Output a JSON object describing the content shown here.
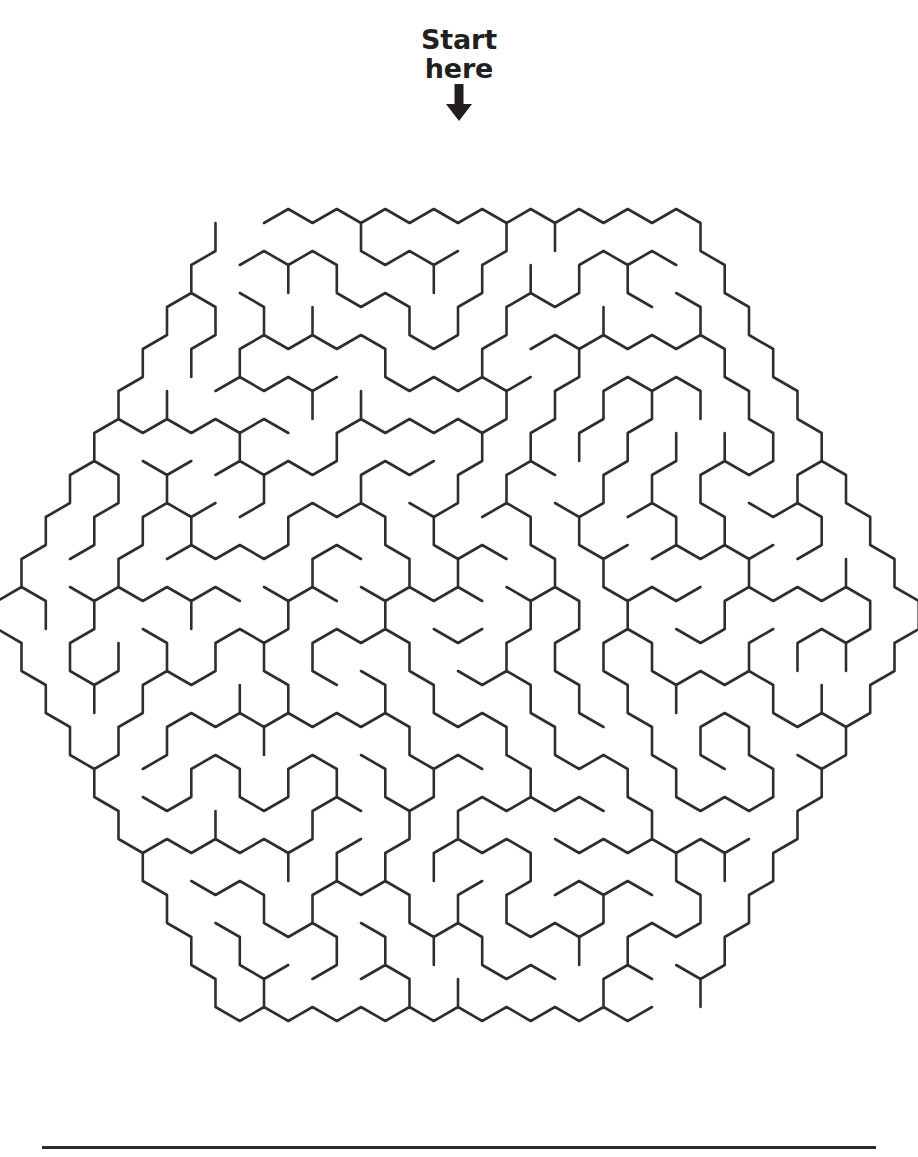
{
  "page": {
    "background_color": "#ffffff",
    "width": 918,
    "height": 1157
  },
  "start_marker": {
    "label": "Start\nhere",
    "label_line_1": "Start",
    "label_line_2": "here",
    "text_color": "#231f20",
    "arrow_icon": "down-arrow-icon",
    "arrow_color": "#231f20"
  },
  "maze": {
    "shape": "hexagon",
    "cell_shape": "hexagon",
    "orientation": "pointy-top",
    "line_color": "#2e2e2e",
    "line_width": 2.6,
    "rings": 9,
    "cell_size": 28,
    "center_x": 458,
    "center_y": 615,
    "entrance": "top-apex",
    "exit": "bottom-apex",
    "goal": "center"
  },
  "footer": {
    "rule_color": "#2b2b2b",
    "rule_visible": true
  }
}
